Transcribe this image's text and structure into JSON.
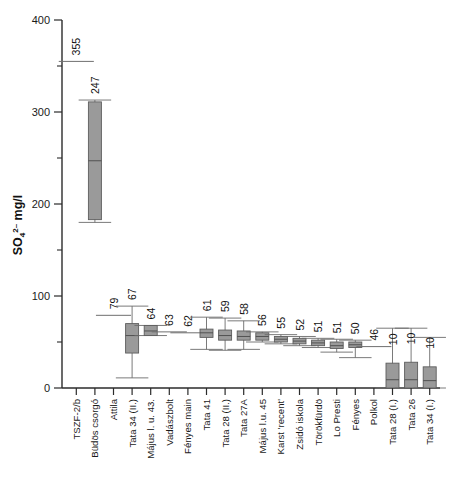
{
  "chart_data": {
    "type": "box",
    "title": "",
    "xlabel": "",
    "ylabel": "SO4 2- mg/l",
    "ylabel_base": "SO",
    "ylabel_sub": "4",
    "ylabel_sup": "2–",
    "ylabel_unit": " mg/l",
    "ylim": [
      0,
      400
    ],
    "yticks": [
      0,
      100,
      200,
      300,
      400
    ],
    "ytick_labels": [
      "0",
      "100",
      "200",
      "300",
      "400"
    ],
    "yminor_ticks": [
      50,
      150,
      250,
      350
    ],
    "grid": false,
    "legend": "none",
    "categories": [
      "TSZF-2/b",
      "Büdös csorgó",
      "Attila",
      "Tata 34 (II.)",
      "Május l. u. 43.",
      "Vadászbolt",
      "Fényes main",
      "Tata 41",
      "Tata 28 (II.)",
      "Tata 27A",
      "Május l.u. 45",
      "Karst 'recent'",
      "Zsidó iskola",
      "Törökfürdö",
      "Lo Presti",
      "Fényes",
      "Polkol",
      "Tata 28 (I.)",
      "Tata 26",
      "Tata 34 (I.)"
    ],
    "value_labels": [
      "355",
      "247",
      "79",
      "67",
      "64",
      "63",
      "62",
      "61",
      "59",
      "58",
      "56",
      "55",
      "52",
      "51",
      "51",
      "50",
      "46",
      "10",
      "10",
      "10"
    ],
    "series": [
      {
        "name": "TSZF-2/b",
        "label": "355",
        "kind": "line",
        "median": 355
      },
      {
        "name": "Büdös csorgó",
        "label": "247",
        "kind": "box",
        "whisker_low": 180,
        "q1": 183,
        "median": 247,
        "q3": 311,
        "whisker_high": 313
      },
      {
        "name": "Attila",
        "label": "79",
        "kind": "line",
        "median": 79
      },
      {
        "name": "Tata 34 (II.)",
        "label": "67",
        "kind": "box",
        "whisker_low": 11,
        "q1": 38,
        "median": 57,
        "q3": 70,
        "whisker_high": 89
      },
      {
        "name": "Május l. u. 43.",
        "label": "64",
        "kind": "box",
        "whisker_low": 57,
        "q1": 57,
        "median": 62,
        "q3": 68,
        "whisker_high": 68
      },
      {
        "name": "Vadászbolt",
        "label": "63",
        "kind": "line",
        "median": 61
      },
      {
        "name": "Fényes main",
        "label": "62",
        "kind": "line",
        "median": 60
      },
      {
        "name": "Tata 41",
        "label": "61",
        "kind": "box",
        "whisker_low": 42,
        "q1": 55,
        "median": 60,
        "q3": 64,
        "whisker_high": 77
      },
      {
        "name": "Tata 28 (II.)",
        "label": "59",
        "kind": "box",
        "whisker_low": 41,
        "q1": 52,
        "median": 57,
        "q3": 63,
        "whisker_high": 76
      },
      {
        "name": "Tata 27A",
        "label": "58",
        "kind": "box",
        "whisker_low": 42,
        "q1": 52,
        "median": 56,
        "q3": 62,
        "whisker_high": 73
      },
      {
        "name": "Május l.u. 45",
        "label": "56",
        "kind": "box",
        "whisker_low": 50,
        "q1": 52,
        "median": 56,
        "q3": 60,
        "whisker_high": 61
      },
      {
        "name": "Karst 'recent'",
        "label": "55",
        "kind": "box",
        "whisker_low": 48,
        "q1": 50,
        "median": 53,
        "q3": 56,
        "whisker_high": 58
      },
      {
        "name": "Zsidó iskola",
        "label": "52",
        "kind": "box",
        "whisker_low": 46,
        "q1": 48,
        "median": 51,
        "q3": 54,
        "whisker_high": 56
      },
      {
        "name": "Törökfürdö",
        "label": "51",
        "kind": "box",
        "whisker_low": 44,
        "q1": 46,
        "median": 49,
        "q3": 52,
        "whisker_high": 54
      },
      {
        "name": "Lo Presti",
        "label": "51",
        "kind": "box",
        "whisker_low": 39,
        "q1": 43,
        "median": 46,
        "q3": 50,
        "whisker_high": 53
      },
      {
        "name": "Fényes",
        "label": "50",
        "kind": "box",
        "whisker_low": 33,
        "q1": 44,
        "median": 47,
        "q3": 50,
        "whisker_high": 52
      },
      {
        "name": "Polkol",
        "label": "46",
        "kind": "line",
        "median": 45
      },
      {
        "name": "Tata 28 (I.)",
        "label": "10",
        "kind": "box",
        "whisker_low": 0,
        "q1": 0,
        "median": 9,
        "q3": 27,
        "whisker_high": 65
      },
      {
        "name": "Tata 26",
        "label": "10",
        "kind": "box",
        "whisker_low": 0,
        "q1": 0,
        "median": 9,
        "q3": 28,
        "whisker_high": 65
      },
      {
        "name": "Tata 34 (I.)",
        "label": "10",
        "kind": "box",
        "whisker_low": 0,
        "q1": 0,
        "median": 8,
        "q3": 23,
        "whisker_high": 55
      }
    ]
  }
}
